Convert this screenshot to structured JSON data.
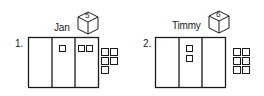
{
  "problems": [
    {
      "number": "1.",
      "name": "Jan",
      "die_value": "5",
      "columns": 3,
      "squares_in_columns": [
        0,
        1,
        2
      ],
      "loose_squares": 5
    },
    {
      "number": "2.",
      "name": "Timmy",
      "die_value": "6",
      "columns": 3,
      "squares_in_columns": [
        0,
        2,
        0
      ],
      "loose_squares": 6
    }
  ],
  "colors": {
    "stroke": "#1a1a1a",
    "background": "#ffffff"
  }
}
